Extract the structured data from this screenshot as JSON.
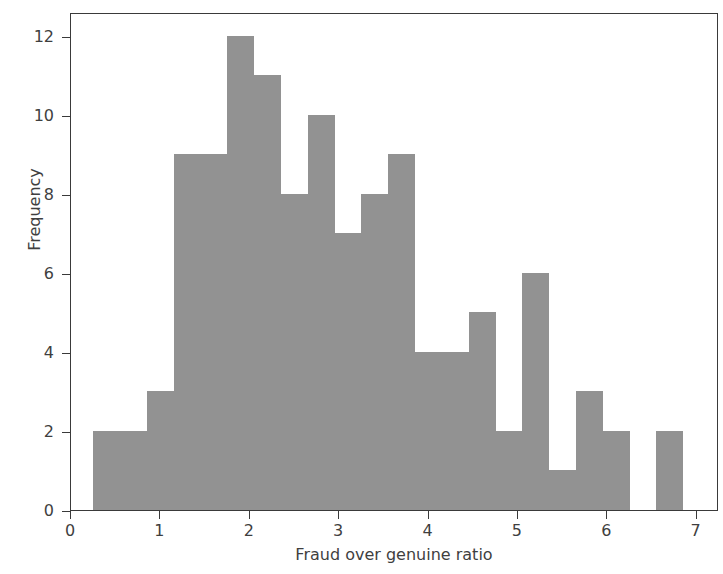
{
  "chart_data": {
    "type": "bar",
    "title": "",
    "xlabel": "Fraud over genuine ratio",
    "ylabel": "Frequency",
    "xlim": [
      0,
      7.25
    ],
    "ylim": [
      0,
      12.6
    ],
    "grid": false,
    "legend": null,
    "bin_width": 0.3,
    "bar_color": "#929292",
    "axis_color": "#3a3a3a",
    "xticks": [
      "0",
      "1",
      "2",
      "3",
      "4",
      "5",
      "6",
      "7"
    ],
    "xtick_values": [
      0,
      1,
      2,
      3,
      4,
      5,
      6,
      7
    ],
    "yticks": [
      "0",
      "2",
      "4",
      "6",
      "8",
      "10",
      "12"
    ],
    "ytick_values": [
      0,
      2,
      4,
      6,
      8,
      10,
      12
    ],
    "bins": [
      {
        "x0": 0.25,
        "x1": 0.55,
        "value": 2
      },
      {
        "x0": 0.55,
        "x1": 0.85,
        "value": 2
      },
      {
        "x0": 0.85,
        "x1": 1.15,
        "value": 3
      },
      {
        "x0": 1.15,
        "x1": 1.45,
        "value": 9
      },
      {
        "x0": 1.45,
        "x1": 1.75,
        "value": 9
      },
      {
        "x0": 1.75,
        "x1": 2.05,
        "value": 12
      },
      {
        "x0": 2.05,
        "x1": 2.35,
        "value": 11
      },
      {
        "x0": 2.35,
        "x1": 2.65,
        "value": 8
      },
      {
        "x0": 2.65,
        "x1": 2.95,
        "value": 10
      },
      {
        "x0": 2.95,
        "x1": 3.25,
        "value": 7
      },
      {
        "x0": 3.25,
        "x1": 3.55,
        "value": 8
      },
      {
        "x0": 3.55,
        "x1": 3.85,
        "value": 9
      },
      {
        "x0": 3.85,
        "x1": 4.15,
        "value": 4
      },
      {
        "x0": 4.15,
        "x1": 4.45,
        "value": 4
      },
      {
        "x0": 4.45,
        "x1": 4.75,
        "value": 5
      },
      {
        "x0": 4.75,
        "x1": 5.05,
        "value": 2
      },
      {
        "x0": 5.05,
        "x1": 5.35,
        "value": 6
      },
      {
        "x0": 5.35,
        "x1": 5.65,
        "value": 1
      },
      {
        "x0": 5.65,
        "x1": 5.95,
        "value": 3
      },
      {
        "x0": 5.95,
        "x1": 6.25,
        "value": 2
      },
      {
        "x0": 6.55,
        "x1": 6.85,
        "value": 2
      }
    ],
    "categories": [
      "0.25-0.55",
      "0.55-0.85",
      "0.85-1.15",
      "1.15-1.45",
      "1.45-1.75",
      "1.75-2.05",
      "2.05-2.35",
      "2.35-2.65",
      "2.65-2.95",
      "2.95-3.25",
      "3.25-3.55",
      "3.55-3.85",
      "3.85-4.15",
      "4.15-4.45",
      "4.45-4.75",
      "4.75-5.05",
      "5.05-5.35",
      "5.35-5.65",
      "5.65-5.95",
      "5.95-6.25",
      "6.55-6.85"
    ],
    "values": [
      2,
      2,
      3,
      9,
      9,
      12,
      11,
      8,
      10,
      7,
      8,
      9,
      4,
      4,
      5,
      2,
      6,
      1,
      3,
      2,
      2
    ]
  }
}
